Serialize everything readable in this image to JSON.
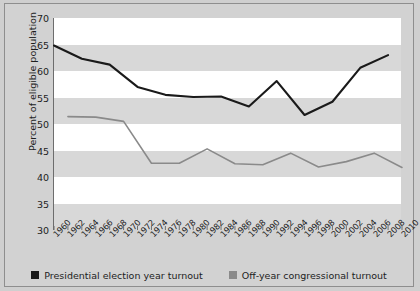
{
  "chart_data": {
    "type": "line",
    "title": "",
    "xlabel": "",
    "ylabel": "Percent of eligible population",
    "ylim": [
      30,
      70
    ],
    "xlim": [
      1960,
      2010
    ],
    "yticks": [
      70,
      65,
      60,
      55,
      50,
      45,
      40,
      35,
      30
    ],
    "grid": "horizontal-bands",
    "legend_position": "bottom-center",
    "x": [
      1960,
      1962,
      1964,
      1966,
      1968,
      1970,
      1972,
      1974,
      1976,
      1978,
      1980,
      1982,
      1984,
      1986,
      1988,
      1990,
      1992,
      1994,
      1996,
      1998,
      2000,
      2002,
      2004,
      2006,
      2008,
      2010
    ],
    "series": [
      {
        "name": "Presidential election year turnout",
        "color": "#1a1a1a",
        "x": [
          1960,
          1964,
          1968,
          1972,
          1976,
          1980,
          1984,
          1988,
          1992,
          1996,
          2000,
          2004,
          2008
        ],
        "values": [
          64.8,
          62.3,
          61.2,
          57.0,
          55.5,
          55.1,
          55.2,
          53.3,
          58.1,
          51.7,
          54.2,
          60.6,
          63.0
        ]
      },
      {
        "name": "Off-year congressional turnout",
        "color": "#8a8a8a",
        "x": [
          1962,
          1966,
          1970,
          1974,
          1978,
          1982,
          1986,
          1990,
          1994,
          1998,
          2002,
          2006,
          2010
        ],
        "values": [
          51.4,
          51.3,
          50.5,
          42.6,
          42.6,
          45.3,
          42.5,
          42.3,
          44.5,
          41.9,
          42.9,
          44.5,
          41.8
        ]
      }
    ]
  },
  "axis": {
    "y_title": "Percent of eligible population",
    "y_tick_labels": [
      "70",
      "65",
      "60",
      "55",
      "50",
      "45",
      "40",
      "35",
      "30"
    ],
    "x_tick_labels": [
      "1960",
      "1962",
      "1964",
      "1966",
      "1968",
      "1970",
      "1972",
      "1974",
      "1976",
      "1978",
      "1980",
      "1982",
      "1984",
      "1986",
      "1988",
      "1990",
      "1992",
      "1994",
      "1996",
      "1998",
      "2000",
      "2002",
      "2004",
      "2006",
      "2008",
      "2010"
    ]
  },
  "legend": {
    "items": [
      {
        "label": "Presidential election year turnout",
        "color": "#1a1a1a"
      },
      {
        "label": "Off-year congressional turnout",
        "color": "#8a8a8a"
      }
    ]
  },
  "colors": {
    "presidential": "#1a1a1a",
    "offyear": "#8a8a8a",
    "band": "#d8d8d8",
    "figure_background": "#d2d2d2",
    "plot_background": "#ffffff"
  }
}
